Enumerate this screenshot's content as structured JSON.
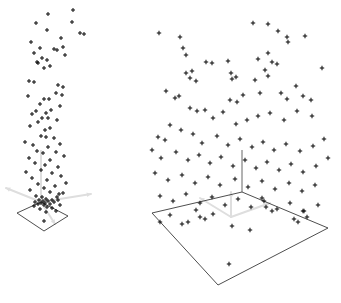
{
  "figure": {
    "title": "",
    "background_color": "#ffffff",
    "width": 341,
    "height": 303,
    "panel_count": 2,
    "marker_color": "#111111",
    "plane_color": "#3a3a3a",
    "axis_color": "#dedede",
    "vertical_axis_color": "#555555"
  },
  "chart_data": [
    {
      "type": "scatter",
      "name": "left-panel",
      "title": "",
      "subtitle": "",
      "xlabel": "",
      "ylabel": "",
      "zlabel": "",
      "projection": "3d",
      "grid": false,
      "legend": "none",
      "annotations": [],
      "axis_origin_px": [
        41,
        202
      ],
      "ground_plane_px": [
        [
          17,
          213
        ],
        [
          41,
          202
        ],
        [
          68,
          216
        ],
        [
          44,
          231
        ]
      ],
      "vertical_axis_px": [
        [
          41,
          202
        ],
        [
          41,
          150
        ]
      ],
      "axis_arrows_px": [
        [
          [
            41,
            202
          ],
          [
            6,
            188
          ]
        ],
        [
          [
            41,
            202
          ],
          [
            91,
            194
          ]
        ],
        [
          [
            41,
            202
          ],
          [
            55,
            224
          ]
        ]
      ],
      "description": "Tall narrow vertical column of scattered points rising from a small ground plane",
      "points_px": [
        [
          48,
          14
        ],
        [
          73,
          10
        ],
        [
          72,
          22
        ],
        [
          36,
          23
        ],
        [
          47,
          30
        ],
        [
          80,
          33
        ],
        [
          84,
          34
        ],
        [
          61,
          38
        ],
        [
          31,
          42
        ],
        [
          40,
          48
        ],
        [
          54,
          49
        ],
        [
          57,
          50
        ],
        [
          34,
          53
        ],
        [
          65,
          55
        ],
        [
          42,
          58
        ],
        [
          47,
          60
        ],
        [
          37,
          62
        ],
        [
          38,
          63
        ],
        [
          50,
          66
        ],
        [
          44,
          68
        ],
        [
          63,
          47
        ],
        [
          29,
          81
        ],
        [
          34,
          82
        ],
        [
          58,
          85
        ],
        [
          63,
          87
        ],
        [
          28,
          96
        ],
        [
          44,
          99
        ],
        [
          49,
          99
        ],
        [
          56,
          93
        ],
        [
          40,
          104
        ],
        [
          60,
          106
        ],
        [
          36,
          111
        ],
        [
          46,
          113
        ],
        [
          51,
          110
        ],
        [
          32,
          114
        ],
        [
          42,
          118
        ],
        [
          48,
          118
        ],
        [
          38,
          122
        ],
        [
          57,
          120
        ],
        [
          30,
          126
        ],
        [
          50,
          128
        ],
        [
          45,
          130
        ],
        [
          62,
          95
        ],
        [
          25,
          142
        ],
        [
          41,
          136
        ],
        [
          46,
          137
        ],
        [
          54,
          138
        ],
        [
          33,
          145
        ],
        [
          48,
          147
        ],
        [
          60,
          144
        ],
        [
          37,
          151
        ],
        [
          43,
          153
        ],
        [
          56,
          152
        ],
        [
          29,
          158
        ],
        [
          50,
          160
        ],
        [
          64,
          156
        ],
        [
          35,
          163
        ],
        [
          45,
          165
        ],
        [
          58,
          167
        ],
        [
          26,
          172
        ],
        [
          41,
          170
        ],
        [
          52,
          173
        ],
        [
          32,
          178
        ],
        [
          47,
          180
        ],
        [
          61,
          176
        ],
        [
          38,
          184
        ],
        [
          55,
          186
        ],
        [
          44,
          188
        ],
        [
          66,
          183
        ],
        [
          30,
          190
        ],
        [
          50,
          192
        ],
        [
          59,
          194
        ],
        [
          36,
          196
        ],
        [
          42,
          197
        ],
        [
          57,
          197
        ],
        [
          63,
          193
        ],
        [
          46,
          199
        ],
        [
          52,
          200
        ],
        [
          39,
          200
        ],
        [
          43,
          201
        ],
        [
          48,
          201
        ],
        [
          35,
          202
        ],
        [
          54,
          202
        ],
        [
          41,
          203
        ],
        [
          45,
          203
        ],
        [
          58,
          200
        ],
        [
          38,
          204
        ],
        [
          50,
          204
        ],
        [
          44,
          205
        ],
        [
          47,
          207
        ],
        [
          34,
          206
        ],
        [
          60,
          205
        ],
        [
          52,
          208
        ],
        [
          40,
          209
        ],
        [
          46,
          212
        ],
        [
          56,
          211
        ],
        [
          44,
          221
        ]
      ]
    },
    {
      "type": "scatter",
      "name": "right-panel",
      "title": "",
      "subtitle": "",
      "xlabel": "",
      "ylabel": "",
      "zlabel": "",
      "projection": "3d",
      "grid": false,
      "legend": "none",
      "annotations": [],
      "axis_origin_px": [
        231,
        217
      ],
      "ground_plane_px": [
        [
          152,
          213
        ],
        [
          242,
          192
        ],
        [
          328,
          228
        ],
        [
          218,
          285
        ]
      ],
      "vertical_axis_px": [
        [
          242,
          192
        ],
        [
          242,
          150
        ]
      ],
      "axis_arrows_px": [
        [
          [
            231,
            217
          ],
          [
            200,
            198
          ]
        ],
        [
          [
            231,
            217
          ],
          [
            270,
            203
          ]
        ],
        [
          [
            231,
            217
          ],
          [
            231,
            192
          ]
        ]
      ],
      "description": "Wide spread of scattered points above a large ground plane",
      "points_px": [
        [
          159,
          33
        ],
        [
          253,
          23
        ],
        [
          268,
          24
        ],
        [
          180,
          37
        ],
        [
          183,
          48
        ],
        [
          272,
          62
        ],
        [
          277,
          64
        ],
        [
          186,
          55
        ],
        [
          268,
          53
        ],
        [
          278,
          31
        ],
        [
          287,
          37
        ],
        [
          288,
          42
        ],
        [
          305,
          36
        ],
        [
          322,
          68
        ],
        [
          192,
          71
        ],
        [
          186,
          73
        ],
        [
          190,
          78
        ],
        [
          196,
          81
        ],
        [
          206,
          62
        ],
        [
          212,
          63
        ],
        [
          228,
          61
        ],
        [
          231,
          73
        ],
        [
          236,
          77
        ],
        [
          232,
          79
        ],
        [
          258,
          59
        ],
        [
          265,
          70
        ],
        [
          268,
          76
        ],
        [
          255,
          80
        ],
        [
          166,
          91
        ],
        [
          175,
          98
        ],
        [
          179,
          96
        ],
        [
          230,
          100
        ],
        [
          237,
          102
        ],
        [
          243,
          95
        ],
        [
          260,
          93
        ],
        [
          281,
          93
        ],
        [
          287,
          99
        ],
        [
          296,
          86
        ],
        [
          303,
          96
        ],
        [
          311,
          100
        ],
        [
          190,
          108
        ],
        [
          197,
          111
        ],
        [
          205,
          110
        ],
        [
          213,
          118
        ],
        [
          223,
          112
        ],
        [
          236,
          124
        ],
        [
          247,
          120
        ],
        [
          258,
          116
        ],
        [
          270,
          113
        ],
        [
          284,
          120
        ],
        [
          297,
          111
        ],
        [
          312,
          116
        ],
        [
          170,
          125
        ],
        [
          181,
          130
        ],
        [
          158,
          137
        ],
        [
          165,
          140
        ],
        [
          193,
          134
        ],
        [
          202,
          143
        ],
        [
          217,
          136
        ],
        [
          228,
          145
        ],
        [
          240,
          139
        ],
        [
          252,
          147
        ],
        [
          263,
          142
        ],
        [
          274,
          150
        ],
        [
          286,
          144
        ],
        [
          300,
          151
        ],
        [
          313,
          146
        ],
        [
          324,
          139
        ],
        [
          152,
          150
        ],
        [
          161,
          158
        ],
        [
          176,
          152
        ],
        [
          188,
          160
        ],
        [
          199,
          155
        ],
        [
          210,
          163
        ],
        [
          221,
          157
        ],
        [
          233,
          166
        ],
        [
          245,
          160
        ],
        [
          256,
          168
        ],
        [
          267,
          162
        ],
        [
          279,
          170
        ],
        [
          291,
          164
        ],
        [
          303,
          172
        ],
        [
          316,
          166
        ],
        [
          328,
          158
        ],
        [
          155,
          173
        ],
        [
          168,
          180
        ],
        [
          182,
          175
        ],
        [
          195,
          183
        ],
        [
          208,
          177
        ],
        [
          220,
          185
        ],
        [
          235,
          179
        ],
        [
          248,
          187
        ],
        [
          262,
          181
        ],
        [
          275,
          189
        ],
        [
          289,
          183
        ],
        [
          302,
          191
        ],
        [
          315,
          185
        ],
        [
          160,
          196
        ],
        [
          173,
          201
        ],
        [
          186,
          194
        ],
        [
          200,
          203
        ],
        [
          212,
          197
        ],
        [
          225,
          205
        ],
        [
          238,
          199
        ],
        [
          251,
          207
        ],
        [
          264,
          201
        ],
        [
          277,
          209
        ],
        [
          290,
          203
        ],
        [
          304,
          211
        ],
        [
          318,
          205
        ],
        [
          262,
          198
        ],
        [
          266,
          207
        ],
        [
          272,
          211
        ],
        [
          294,
          219
        ],
        [
          298,
          222
        ],
        [
          303,
          211
        ],
        [
          307,
          217
        ],
        [
          196,
          210
        ],
        [
          200,
          217
        ],
        [
          205,
          219
        ],
        [
          213,
          214
        ],
        [
          170,
          215
        ],
        [
          160,
          222
        ],
        [
          182,
          224
        ],
        [
          188,
          222
        ],
        [
          232,
          226
        ],
        [
          250,
          230
        ],
        [
          229,
          264
        ]
      ]
    }
  ]
}
